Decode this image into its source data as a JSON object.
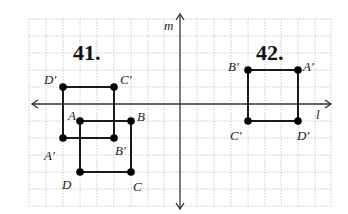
{
  "figure": {
    "problems": [
      {
        "number": "41.",
        "original": {
          "A": {
            "label": "A",
            "x": 80,
            "y": 121
          },
          "B": {
            "label": "B",
            "x": 131,
            "y": 121
          },
          "C": {
            "label": "C",
            "x": 131,
            "y": 172
          },
          "D": {
            "label": "D",
            "x": 80,
            "y": 172
          }
        },
        "image": {
          "A'": {
            "label": "A′",
            "x": 63,
            "y": 138
          },
          "B'": {
            "label": "B′",
            "x": 114,
            "y": 138
          },
          "C'": {
            "label": "C′",
            "x": 114,
            "y": 87
          },
          "D'": {
            "label": "D′",
            "x": 63,
            "y": 87
          }
        }
      },
      {
        "number": "42.",
        "image": {
          "A'": {
            "label": "A′",
            "x": 298,
            "y": 70
          },
          "B'": {
            "label": "B′",
            "x": 248,
            "y": 70
          },
          "C'": {
            "label": "C′",
            "x": 248,
            "y": 121
          },
          "D'": {
            "label": "D′",
            "x": 298,
            "y": 121
          }
        }
      }
    ],
    "axes": {
      "vertical_label": "m",
      "horizontal_label": "l"
    },
    "colors": {
      "line": "#1a1a1a",
      "grid": "#bdbdbd",
      "point": "#000000"
    }
  }
}
